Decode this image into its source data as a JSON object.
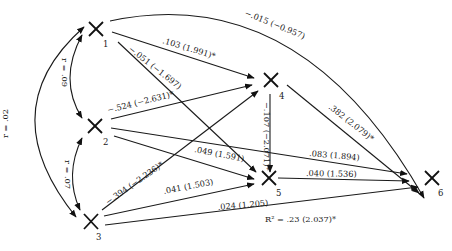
{
  "diagram": {
    "type": "path-diagram",
    "nodes": [
      {
        "id": "1",
        "label": "1"
      },
      {
        "id": "2",
        "label": "2"
      },
      {
        "id": "3",
        "label": "3"
      },
      {
        "id": "4",
        "label": "4"
      },
      {
        "id": "5",
        "label": "5"
      },
      {
        "id": "6",
        "label": "6"
      }
    ],
    "correlations": [
      {
        "from": "1",
        "to": "2",
        "label": "r = .09"
      },
      {
        "from": "2",
        "to": "3",
        "label": "r = .07"
      },
      {
        "from": "1",
        "to": "3",
        "label": "r = .02"
      }
    ],
    "paths": [
      {
        "from": "1",
        "to": "6",
        "label": "−.015 (−0.957)"
      },
      {
        "from": "1",
        "to": "4",
        "label": ".103 (1.991)*"
      },
      {
        "from": "1",
        "to": "5",
        "label": "−.051 (−1.697)"
      },
      {
        "from": "2",
        "to": "4",
        "label": "−.524 (−2.631)*"
      },
      {
        "from": "2",
        "to": "5",
        "label": ".049 (1.591)"
      },
      {
        "from": "2",
        "to": "6",
        "label": ".083 (1.894)"
      },
      {
        "from": "3",
        "to": "4",
        "label": "−.394 (−2.236)*"
      },
      {
        "from": "3",
        "to": "5",
        "label": ".041 (1.503)"
      },
      {
        "from": "3",
        "to": "6",
        "label": ".024 (1.205)"
      },
      {
        "from": "4",
        "to": "5",
        "label": "−.107 (−2.071)*"
      },
      {
        "from": "4",
        "to": "6",
        "label": ".382 (2.079)*"
      },
      {
        "from": "5",
        "to": "6",
        "label": ".040 (1.536)"
      }
    ],
    "r_squared": "R² = .23 (2.037)*"
  }
}
